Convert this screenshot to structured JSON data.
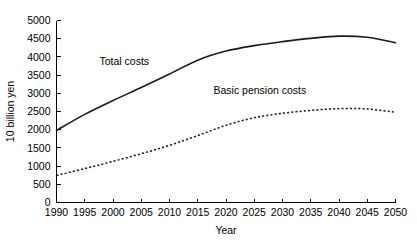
{
  "chart_data": {
    "type": "line",
    "title": "",
    "xlabel": "Year",
    "ylabel": "10 billion yen",
    "xlim": [
      1990,
      2050
    ],
    "ylim": [
      0,
      5000
    ],
    "grid": false,
    "legend_position": "inline-annotations",
    "x": [
      1990,
      1995,
      2000,
      2005,
      2010,
      2015,
      2020,
      2025,
      2030,
      2035,
      2040,
      2045,
      2050
    ],
    "xticks": [
      "1990",
      "1995",
      "2000",
      "2005",
      "2010",
      "2015",
      "2020",
      "2025",
      "2030",
      "2035",
      "2040",
      "2045",
      "2050"
    ],
    "yticks": [
      "0",
      "500",
      "1000",
      "1500",
      "2000",
      "2500",
      "3000",
      "3500",
      "4000",
      "4500",
      "5000"
    ],
    "series": [
      {
        "name": "Total costs",
        "style": "solid",
        "color": "#1a1a1a",
        "label_x": 2002,
        "label_y": 3780,
        "values": [
          1980,
          2420,
          2800,
          3160,
          3530,
          3910,
          4160,
          4310,
          4420,
          4510,
          4570,
          4540,
          4390
        ]
      },
      {
        "name": "Basic pension costs",
        "style": "dashed",
        "color": "#1a1a1a",
        "label_x": 2026,
        "label_y": 2980,
        "values": [
          740,
          930,
          1130,
          1340,
          1570,
          1840,
          2120,
          2330,
          2450,
          2530,
          2580,
          2570,
          2480
        ]
      }
    ]
  },
  "axes": {
    "x_title": "Year",
    "y_title": "10 billion yen"
  }
}
